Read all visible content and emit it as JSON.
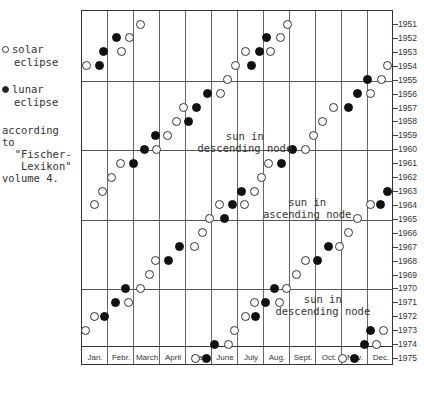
{
  "chart_data": {
    "type": "scatter",
    "title": "",
    "xlabel": "Month",
    "ylabel": "Year",
    "x_categories": [
      "Jan.",
      "Febr.",
      "March",
      "April",
      "May",
      "June",
      "July",
      "Aug.",
      "Sept.",
      "Oct.",
      "Nov.",
      "Dec."
    ],
    "y_ticks": [
      1951,
      1952,
      1953,
      1954,
      1955,
      1956,
      1957,
      1958,
      1959,
      1960,
      1961,
      1962,
      1963,
      1964,
      1965,
      1966,
      1967,
      1968,
      1969,
      1970,
      1971,
      1972,
      1973,
      1974,
      1975
    ],
    "y_major_gridlines": [
      1955,
      1960,
      1965,
      1970
    ],
    "ylim": [
      1951,
      1975
    ],
    "xlim_months": [
      0,
      12
    ],
    "legend": [
      {
        "name": "solar eclipse",
        "symbol": "open-circle"
      },
      {
        "name": "lunar eclipse",
        "symbol": "filled-circle"
      }
    ],
    "source_note": "according to \"Fischer-Lexikon\" volume 4.",
    "annotations": [
      {
        "text": "sun in\ndescending node",
        "year": 1959.5,
        "month": 6.3
      },
      {
        "text": "sun in\nascending node",
        "year": 1964.2,
        "month": 8.7
      },
      {
        "text": "sun in\ndescending node",
        "year": 1971.2,
        "month": 9.3
      }
    ],
    "series": [
      {
        "name": "solar eclipse",
        "points": [
          {
            "year": 1951,
            "month": 2.27
          },
          {
            "year": 1951,
            "month": 7.96
          },
          {
            "year": 1952,
            "month": 1.85
          },
          {
            "year": 1952,
            "month": 7.69
          },
          {
            "year": 1953,
            "month": 1.54
          },
          {
            "year": 1953,
            "month": 6.31
          },
          {
            "year": 1953,
            "month": 7.27
          },
          {
            "year": 1954,
            "month": 0.23
          },
          {
            "year": 1954,
            "month": 5.96
          },
          {
            "year": 1954,
            "month": 11.77
          },
          {
            "year": 1955,
            "month": 5.65
          },
          {
            "year": 1955,
            "month": 11.54
          },
          {
            "year": 1956,
            "month": 5.35
          },
          {
            "year": 1956,
            "month": 11.12
          },
          {
            "year": 1957,
            "month": 3.96
          },
          {
            "year": 1957,
            "month": 9.73
          },
          {
            "year": 1958,
            "month": 3.69
          },
          {
            "year": 1958,
            "month": 9.27
          },
          {
            "year": 1959,
            "month": 3.31
          },
          {
            "year": 1959,
            "month": 8.96
          },
          {
            "year": 1960,
            "month": 2.92
          },
          {
            "year": 1960,
            "month": 8.65
          },
          {
            "year": 1961,
            "month": 1.5
          },
          {
            "year": 1961,
            "month": 7.23
          },
          {
            "year": 1962,
            "month": 1.19
          },
          {
            "year": 1962,
            "month": 6.96
          },
          {
            "year": 1963,
            "month": 0.81
          },
          {
            "year": 1963,
            "month": 6.69
          },
          {
            "year": 1964,
            "month": 0.5
          },
          {
            "year": 1964,
            "month": 5.31
          },
          {
            "year": 1964,
            "month": 6.27
          },
          {
            "year": 1964,
            "month": 11.12
          },
          {
            "year": 1965,
            "month": 4.96
          },
          {
            "year": 1965,
            "month": 10.65
          },
          {
            "year": 1966,
            "month": 4.69
          },
          {
            "year": 1966,
            "month": 10.27
          },
          {
            "year": 1967,
            "month": 4.35
          },
          {
            "year": 1967,
            "month": 9.96
          },
          {
            "year": 1968,
            "month": 2.88
          },
          {
            "year": 1968,
            "month": 8.62
          },
          {
            "year": 1969,
            "month": 2.65
          },
          {
            "year": 1969,
            "month": 8.27
          },
          {
            "year": 1970,
            "month": 2.27
          },
          {
            "year": 1970,
            "month": 7.92
          },
          {
            "year": 1971,
            "month": 1.81
          },
          {
            "year": 1971,
            "month": 6.69
          },
          {
            "year": 1971,
            "month": 7.65
          },
          {
            "year": 1972,
            "month": 0.5
          },
          {
            "year": 1972,
            "month": 6.31
          },
          {
            "year": 1973,
            "month": 0.19
          },
          {
            "year": 1973,
            "month": 5.92
          },
          {
            "year": 1973,
            "month": 11.65
          },
          {
            "year": 1974,
            "month": 5.69
          },
          {
            "year": 1974,
            "month": 11.38
          },
          {
            "year": 1975,
            "month": 4.42
          },
          {
            "year": 1975,
            "month": 10.04
          }
        ]
      },
      {
        "name": "lunar eclipse",
        "points": [
          {
            "year": 1952,
            "month": 1.38
          },
          {
            "year": 1952,
            "month": 7.12
          },
          {
            "year": 1953,
            "month": 0.88
          },
          {
            "year": 1953,
            "month": 6.85
          },
          {
            "year": 1954,
            "month": 0.73
          },
          {
            "year": 1954,
            "month": 6.54
          },
          {
            "year": 1955,
            "month": 11.0
          },
          {
            "year": 1956,
            "month": 4.85
          },
          {
            "year": 1956,
            "month": 10.62
          },
          {
            "year": 1957,
            "month": 4.46
          },
          {
            "year": 1957,
            "month": 10.27
          },
          {
            "year": 1958,
            "month": 4.15
          },
          {
            "year": 1959,
            "month": 2.85
          },
          {
            "year": 1960,
            "month": 2.46
          },
          {
            "year": 1960,
            "month": 8.12
          },
          {
            "year": 1961,
            "month": 2.0
          },
          {
            "year": 1961,
            "month": 7.73
          },
          {
            "year": 1963,
            "month": 6.19
          },
          {
            "year": 1963,
            "month": 11.77
          },
          {
            "year": 1964,
            "month": 5.81
          },
          {
            "year": 1964,
            "month": 11.5
          },
          {
            "year": 1965,
            "month": 5.5
          },
          {
            "year": 1967,
            "month": 3.77
          },
          {
            "year": 1967,
            "month": 9.5
          },
          {
            "year": 1968,
            "month": 3.38
          },
          {
            "year": 1968,
            "month": 9.08
          },
          {
            "year": 1970,
            "month": 1.73
          },
          {
            "year": 1970,
            "month": 7.46
          },
          {
            "year": 1971,
            "month": 1.31
          },
          {
            "year": 1971,
            "month": 7.08
          },
          {
            "year": 1972,
            "month": 0.92
          },
          {
            "year": 1972,
            "month": 6.73
          },
          {
            "year": 1973,
            "month": 11.15
          },
          {
            "year": 1974,
            "month": 5.15
          },
          {
            "year": 1974,
            "month": 10.92
          },
          {
            "year": 1975,
            "month": 4.81
          },
          {
            "year": 1975,
            "month": 10.5
          }
        ]
      }
    ]
  },
  "legend": {
    "solar_label_1": "solar",
    "solar_label_2": "eclipse",
    "lunar_label_1": "lunar",
    "lunar_label_2": "eclipse"
  },
  "source": {
    "text": "according\nto\n  \"Fischer-\n   Lexikon\"\nvolume 4."
  }
}
